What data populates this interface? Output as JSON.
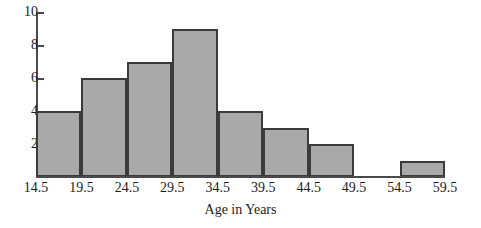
{
  "chart_data": {
    "type": "bar",
    "title": "",
    "subtitle": "",
    "xlabel": "Age in Years",
    "ylabel": "",
    "grid": false,
    "legend": "none",
    "bin_edges": [
      14.5,
      19.5,
      24.5,
      29.5,
      34.5,
      39.5,
      44.5,
      49.5,
      54.5,
      59.5
    ],
    "categories": [
      "14.5-19.5",
      "19.5-24.5",
      "24.5-29.5",
      "29.5-34.5",
      "34.5-39.5",
      "39.5-44.5",
      "44.5-49.5",
      "49.5-54.5",
      "54.5-59.5"
    ],
    "values": [
      4,
      6,
      7,
      9,
      4,
      3,
      2,
      0,
      1
    ],
    "xlim": [
      14.5,
      59.5
    ],
    "ylim": [
      0,
      10
    ],
    "ytick_labels": [
      "10",
      "8",
      "6",
      "4",
      "2"
    ],
    "ytick_values": [
      10,
      8,
      6,
      4,
      2
    ],
    "xtick_labels": [
      "14.5",
      "19.5",
      "24.5",
      "29.5",
      "34.5",
      "39.5",
      "44.5",
      "49.5",
      "54.5",
      "59.5"
    ],
    "bar_fill_color": "#a9a9a9",
    "bar_edge_color": "#3b3b3b",
    "axis_color": "#4a4a4a",
    "text_color": "#1c1c1c",
    "background_color": "#ffffff"
  }
}
